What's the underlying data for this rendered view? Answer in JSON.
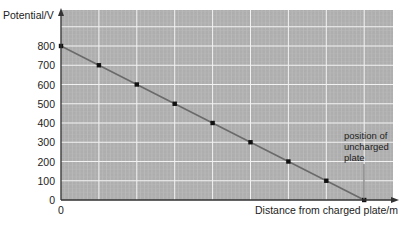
{
  "chart_data": {
    "type": "line",
    "title": "",
    "xlabel": "Distance from charged plate/m",
    "ylabel": "Potential/V",
    "x_tick_labels": [
      "0"
    ],
    "y_tick_labels": [
      "0",
      "100",
      "200",
      "300",
      "400",
      "500",
      "600",
      "700",
      "800"
    ],
    "ylim": [
      0,
      800
    ],
    "grid": true,
    "legend": null,
    "series": [
      {
        "name": "Potential",
        "x": [
          0,
          1,
          2,
          3,
          4,
          5,
          6,
          7,
          8
        ],
        "values": [
          800,
          700,
          600,
          500,
          400,
          300,
          200,
          100,
          0
        ]
      }
    ],
    "annotations": [
      {
        "text": [
          "position of",
          "uncharged",
          "plate"
        ],
        "x": 8,
        "y": 0
      }
    ]
  },
  "colors": {
    "plot_bg": "#aeaeae",
    "grid_major": "#f2f2f2",
    "line": "#6a6a6a",
    "point": "#111111",
    "axis": "#333333"
  }
}
